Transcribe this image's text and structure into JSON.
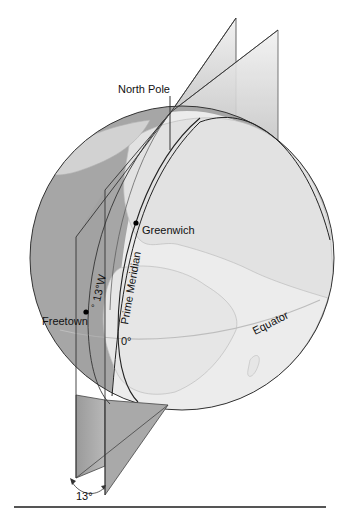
{
  "diagram": {
    "type": "globe-meridian-planes",
    "labels": {
      "north_pole": "North Pole",
      "greenwich": "Greenwich",
      "freetown": "Freetown",
      "longitude_13w": "13°W",
      "degree_mark": "°",
      "prime_meridian": "Prime Meridian",
      "zero_degrees": "0°",
      "equator": "Equator",
      "angle": "13°"
    },
    "points": {
      "greenwich": {
        "name": "Greenwich",
        "longitude": "0°"
      },
      "freetown": {
        "name": "Freetown",
        "longitude": "13°W"
      }
    },
    "angle_between_planes": "13°",
    "colors": {
      "ocean": "#9e9e9e",
      "land": "#e6e6e6",
      "plane": "#c8c8c8",
      "plane_dark": "#8f8f8f",
      "outline": "#333333"
    }
  }
}
